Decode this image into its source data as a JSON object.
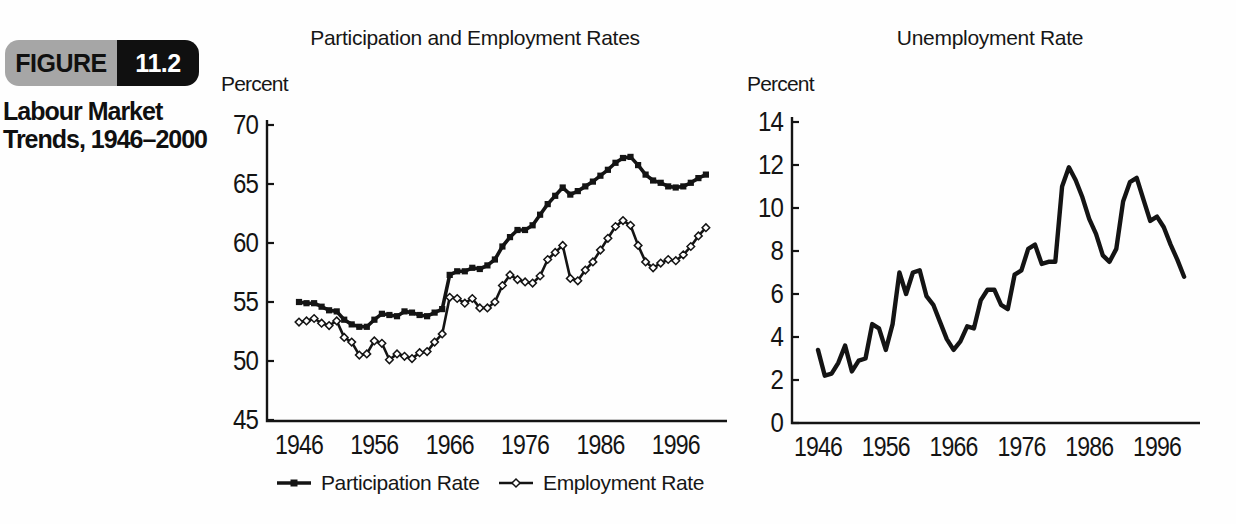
{
  "figure": {
    "label": "FIGURE",
    "number": "11.2",
    "caption_line1": "Labour Market",
    "caption_line2": "Trends, 1946–2000"
  },
  "colors": {
    "ink": "#141414",
    "badge_gray": "#a6a6a6",
    "badge_black": "#101010",
    "badge_number_text": "#ffffff",
    "background": "#fefefe"
  },
  "legend": [
    {
      "label": "Participation Rate",
      "marker": "filled-square"
    },
    {
      "label": "Employment Rate",
      "marker": "open-diamond"
    }
  ],
  "chart_data": [
    {
      "id": "participation-employment",
      "type": "line",
      "title": "Participation and Employment Rates",
      "ylabel": "Percent",
      "xlabel": "",
      "xlim": [
        1946,
        2000
      ],
      "ylim": [
        45,
        70
      ],
      "x_ticks": [
        1946,
        1956,
        1966,
        1976,
        1986,
        1996
      ],
      "y_ticks": [
        45,
        50,
        55,
        60,
        65,
        70
      ],
      "grid": false,
      "legend_position": "bottom",
      "x": [
        1946,
        1947,
        1948,
        1949,
        1950,
        1951,
        1952,
        1953,
        1954,
        1955,
        1956,
        1957,
        1958,
        1959,
        1960,
        1961,
        1962,
        1963,
        1964,
        1965,
        1966,
        1967,
        1968,
        1969,
        1970,
        1971,
        1972,
        1973,
        1974,
        1975,
        1976,
        1977,
        1978,
        1979,
        1980,
        1981,
        1982,
        1983,
        1984,
        1985,
        1986,
        1987,
        1988,
        1989,
        1990,
        1991,
        1992,
        1993,
        1994,
        1995,
        1996,
        1997,
        1998,
        1999,
        2000
      ],
      "series": [
        {
          "name": "Participation Rate",
          "marker": "filled-square",
          "values": [
            55.0,
            54.9,
            54.9,
            54.6,
            54.3,
            54.2,
            53.5,
            53.1,
            52.9,
            52.9,
            53.5,
            54.0,
            53.9,
            53.8,
            54.2,
            54.1,
            53.9,
            53.8,
            54.1,
            54.4,
            57.3,
            57.6,
            57.6,
            57.9,
            57.8,
            58.1,
            58.6,
            59.7,
            60.5,
            61.1,
            61.1,
            61.5,
            62.4,
            63.3,
            64.0,
            64.7,
            64.1,
            64.4,
            64.8,
            65.2,
            65.7,
            66.2,
            66.8,
            67.2,
            67.3,
            66.6,
            65.8,
            65.3,
            65.1,
            64.8,
            64.7,
            64.8,
            65.1,
            65.5,
            65.8
          ]
        },
        {
          "name": "Employment Rate",
          "marker": "open-diamond",
          "values": [
            53.3,
            53.4,
            53.6,
            53.2,
            53.0,
            53.4,
            52.0,
            51.6,
            50.5,
            50.6,
            51.7,
            51.5,
            50.1,
            50.6,
            50.4,
            50.2,
            50.7,
            50.8,
            51.6,
            52.3,
            55.4,
            55.3,
            54.9,
            55.3,
            54.5,
            54.5,
            55.0,
            56.4,
            57.3,
            56.9,
            56.7,
            56.6,
            57.2,
            58.6,
            59.2,
            59.8,
            57.0,
            56.8,
            57.7,
            58.4,
            59.4,
            60.4,
            61.4,
            61.9,
            61.5,
            59.8,
            58.4,
            57.9,
            58.3,
            58.6,
            58.5,
            59.0,
            59.7,
            60.6,
            61.3
          ]
        }
      ]
    },
    {
      "id": "unemployment",
      "type": "line",
      "title": "Unemployment Rate",
      "ylabel": "Percent",
      "xlabel": "",
      "xlim": [
        1946,
        2000
      ],
      "ylim": [
        0,
        14
      ],
      "x_ticks": [
        1946,
        1956,
        1966,
        1976,
        1986,
        1996
      ],
      "y_ticks": [
        0,
        2,
        4,
        6,
        8,
        10,
        12,
        14
      ],
      "grid": false,
      "legend_position": "none",
      "x": [
        1946,
        1947,
        1948,
        1949,
        1950,
        1951,
        1952,
        1953,
        1954,
        1955,
        1956,
        1957,
        1958,
        1959,
        1960,
        1961,
        1962,
        1963,
        1964,
        1965,
        1966,
        1967,
        1968,
        1969,
        1970,
        1971,
        1972,
        1973,
        1974,
        1975,
        1976,
        1977,
        1978,
        1979,
        1980,
        1981,
        1982,
        1983,
        1984,
        1985,
        1986,
        1987,
        1988,
        1989,
        1990,
        1991,
        1992,
        1993,
        1994,
        1995,
        1996,
        1997,
        1998,
        1999,
        2000
      ],
      "series": [
        {
          "name": "Unemployment Rate",
          "marker": "none",
          "values": [
            3.4,
            2.2,
            2.3,
            2.8,
            3.6,
            2.4,
            2.9,
            3.0,
            4.6,
            4.4,
            3.4,
            4.6,
            7.0,
            6.0,
            7.0,
            7.1,
            5.9,
            5.5,
            4.7,
            3.9,
            3.4,
            3.8,
            4.5,
            4.4,
            5.7,
            6.2,
            6.2,
            5.5,
            5.3,
            6.9,
            7.1,
            8.1,
            8.3,
            7.4,
            7.5,
            7.5,
            11.0,
            11.9,
            11.3,
            10.5,
            9.5,
            8.8,
            7.8,
            7.5,
            8.1,
            10.3,
            11.2,
            11.4,
            10.4,
            9.4,
            9.6,
            9.1,
            8.3,
            7.6,
            6.8
          ]
        }
      ]
    }
  ]
}
